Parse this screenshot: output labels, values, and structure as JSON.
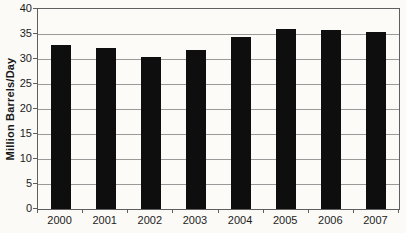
{
  "chart_data": {
    "type": "bar",
    "title": "",
    "xlabel": "",
    "ylabel": "Million Barrels/Day",
    "categories": [
      "2000",
      "2001",
      "2002",
      "2003",
      "2004",
      "2005",
      "2006",
      "2007"
    ],
    "values": [
      32.8,
      32.2,
      30.5,
      31.8,
      34.5,
      36.0,
      35.8,
      35.4
    ],
    "ylim": [
      0,
      40
    ],
    "yticks": [
      0,
      5,
      10,
      15,
      20,
      25,
      30,
      35,
      40
    ],
    "grid": true,
    "legend": "none",
    "bar_color": "#0e0e0e",
    "gridline_color": "#9a9a9a",
    "axis_color": "#5e5e5e",
    "background_color": "#fbfaf7"
  }
}
